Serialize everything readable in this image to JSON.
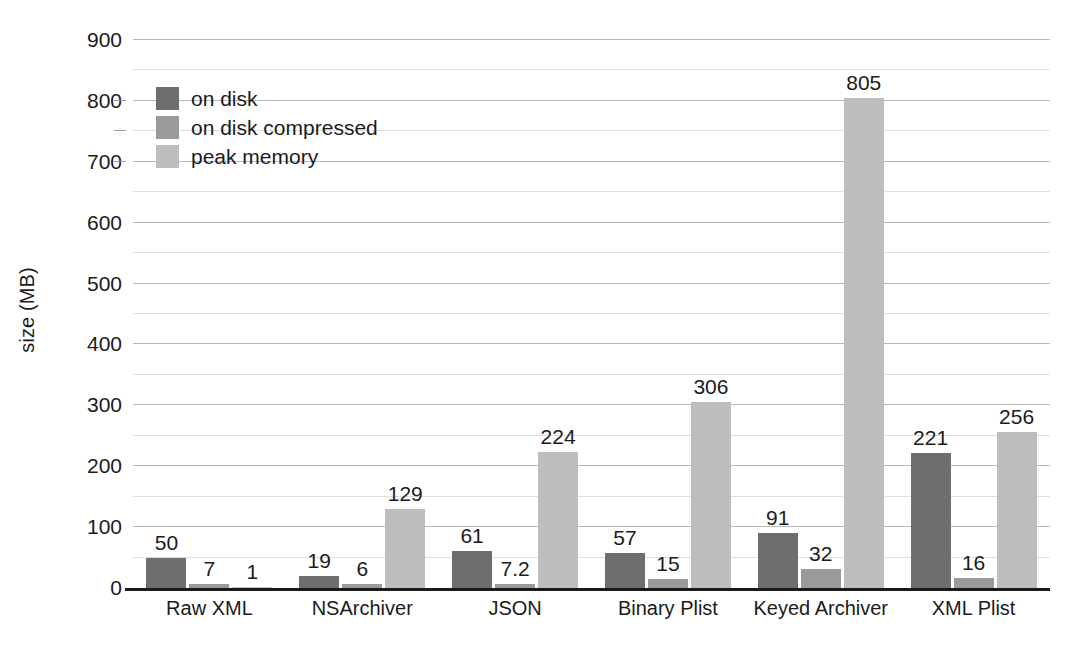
{
  "chart_data": {
    "type": "bar",
    "title": "",
    "xlabel": "",
    "ylabel": "size (MB)",
    "ylim": [
      0,
      900
    ],
    "ytick_step": 100,
    "minor_gridline_step": 50,
    "grid": true,
    "legend_position": "top-left inside plot",
    "categories": [
      "Raw XML",
      "NSArchiver",
      "JSON",
      "Binary Plist",
      "Keyed Archiver",
      "XML Plist"
    ],
    "series": [
      {
        "name": "on disk",
        "color": "#6e6e6e",
        "values": [
          50,
          19,
          61,
          57,
          91,
          221
        ],
        "labels": [
          "50",
          "19",
          "61",
          "57",
          "91",
          "221"
        ]
      },
      {
        "name": "on disk compressed",
        "color": "#9a9a9a",
        "values": [
          7,
          6,
          7.2,
          15,
          32,
          16
        ],
        "labels": [
          "7",
          "6",
          "7.2",
          "15",
          "32",
          "16"
        ]
      },
      {
        "name": "peak memory",
        "color": "#bdbdbd",
        "values": [
          1,
          129,
          224,
          306,
          805,
          256
        ],
        "labels": [
          "1",
          "129",
          "224",
          "306",
          "805",
          "256"
        ]
      }
    ],
    "ytick_labels": [
      "900",
      "800",
      "700",
      "600",
      "500",
      "400",
      "300",
      "200",
      "100",
      "0"
    ],
    "ytick_values": [
      900,
      800,
      700,
      600,
      500,
      400,
      300,
      200,
      100,
      0
    ]
  },
  "colors": {
    "on_disk": "#6e6e6e",
    "on_disk_compressed": "#9a9a9a",
    "peak_memory": "#bdbdbd",
    "axis": "#1b1b1b",
    "gridline_major": "#b9b9b9",
    "gridline_minor": "#dedede",
    "background": "#ffffff"
  }
}
